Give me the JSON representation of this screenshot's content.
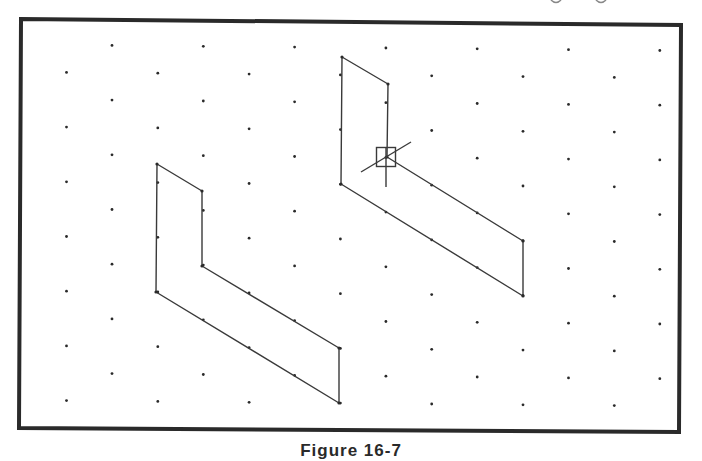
{
  "figure": {
    "caption": "Figure 16-7",
    "colors": {
      "background": "#ffffff",
      "frame": "#2a2a2a",
      "line": "#3a3a3a",
      "dot": "#2a2a2a"
    },
    "frame": {
      "corners": [
        [
          21,
          19
        ],
        [
          681,
          25
        ],
        [
          679,
          432
        ],
        [
          19,
          428
        ]
      ],
      "stroke_width": 4
    },
    "grid": {
      "type": "isometric-dot-grid",
      "rows": 14,
      "row_y_left_start": 45,
      "row_spacing": 27.35,
      "row_drift_per_px": 0.0093,
      "col_spacing": 91.3,
      "even_row_start_x": 112,
      "odd_row_start_x": 66.5,
      "x_max": 672,
      "dot_radius": 1.4
    },
    "shapes": [
      {
        "name": "original-l-shape",
        "points": [
          [
            157,
            164
          ],
          [
            202,
            191
          ],
          [
            202,
            266
          ],
          [
            339,
            348
          ],
          [
            339,
            403
          ],
          [
            156,
            292
          ]
        ]
      },
      {
        "name": "copied-l-shape",
        "points": [
          [
            342,
            57
          ],
          [
            388,
            84
          ],
          [
            387,
            157
          ],
          [
            523,
            241
          ],
          [
            523,
            296
          ],
          [
            341,
            184
          ]
        ]
      }
    ],
    "cursor": {
      "type": "pickbox-isometric-crosshair",
      "center": [
        386,
        157
      ],
      "box_size": 19,
      "vertical_line": [
        [
          386,
          147
        ],
        [
          386,
          187
        ]
      ],
      "iso_line": [
        [
          361,
          172
        ],
        [
          411,
          142
        ]
      ]
    }
  }
}
